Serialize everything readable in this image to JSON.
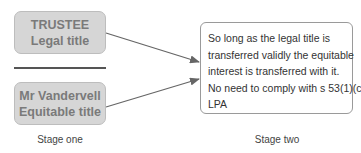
{
  "stage_one": {
    "label": "Stage one",
    "trustee_box": {
      "line1": "TRUSTEE",
      "line2": "Legal title"
    },
    "beneficiary_box": {
      "line1": "Mr Vandervell",
      "line2": "Equitable title"
    }
  },
  "stage_two": {
    "label": "Stage two",
    "result_box": {
      "lines": [
        "So long as the legal title is",
        "transferred validly the equitable",
        "interest is transferred with it.",
        "No need to comply with s 53(1)(c)",
        "LPA"
      ]
    }
  },
  "colors": {
    "box_fill": "#d6d6d6",
    "box_text": "#7a7a7a",
    "arrow": "#666666"
  }
}
